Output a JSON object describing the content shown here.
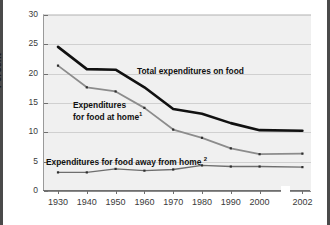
{
  "chart_data": {
    "type": "line",
    "title": "",
    "xlabel": "",
    "ylabel": "Percent",
    "ylim": [
      0,
      30
    ],
    "ytick_step": 5,
    "yticks": [
      0,
      5,
      10,
      15,
      20,
      25,
      30
    ],
    "categories": [
      "1930",
      "1940",
      "1950",
      "1960",
      "1970",
      "1980",
      "1990",
      "2000",
      "2002"
    ],
    "x": [
      1930,
      1940,
      1950,
      1960,
      1970,
      1980,
      1990,
      2000,
      2002
    ],
    "grid": true,
    "legend_position": "inline-annotations",
    "axis_break": {
      "present": true,
      "between": [
        "2000",
        "2002"
      ]
    },
    "series": [
      {
        "name": "Total expenditures on food",
        "color": "#111111",
        "values": [
          24.4,
          20.6,
          20.5,
          17.5,
          13.8,
          13.0,
          11.4,
          10.2,
          10.1
        ]
      },
      {
        "name": "Expenditures for food at home",
        "footnote": "1",
        "color": "#8c8c8c",
        "values": [
          21.2,
          17.5,
          16.8,
          14.0,
          10.3,
          8.9,
          7.1,
          6.1,
          6.2
        ]
      },
      {
        "name": "Expenditures for food away from home",
        "footnote": "2",
        "color": "#6e6e6e",
        "values": [
          3.0,
          3.0,
          3.6,
          3.3,
          3.5,
          4.2,
          4.0,
          4.0,
          3.9
        ]
      }
    ],
    "annotations": [
      {
        "id": "total",
        "text": "Total expenditures on food",
        "footnote": ""
      },
      {
        "id": "at_home_line1",
        "text": "Expenditures",
        "footnote": ""
      },
      {
        "id": "at_home_line2",
        "text": "for food at home",
        "footnote": "1"
      },
      {
        "id": "away_home",
        "text": "Expenditures for food away from home",
        "footnote": "2"
      }
    ]
  },
  "axes": {
    "y_label": "Percent",
    "y_ticks": [
      "30",
      "25",
      "20",
      "15",
      "10",
      "5",
      "0"
    ],
    "x_ticks": [
      "1930",
      "1940",
      "1950",
      "1960",
      "1970",
      "1980",
      "1990",
      "2000",
      "2002"
    ]
  },
  "colors": {
    "plot_background": "#f0f0f0",
    "grid": "#d0d0d0",
    "axis": "#6f6f6f",
    "total_series": "#111111",
    "at_home_series": "#8c8c8c",
    "away_home_series": "#6e6e6e",
    "text": "#1a1a1a"
  }
}
